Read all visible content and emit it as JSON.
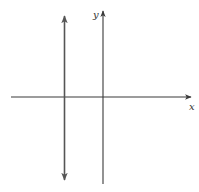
{
  "diagram": {
    "axes": {
      "x_label": "x",
      "y_label": "y",
      "color": "#3a3a3a"
    },
    "vertical_line": {
      "style": "double-headed arrow",
      "color": "#555555",
      "position": "left of y-axis"
    }
  }
}
